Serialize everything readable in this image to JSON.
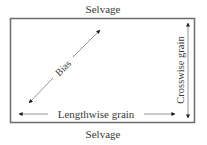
{
  "diagram": {
    "labels": {
      "top_edge": "Selvage",
      "bottom_edge": "Selvage",
      "bias": "Bias",
      "lengthwise": "Lengthwise grain",
      "crosswise": "Crosswise grain"
    },
    "colors": {
      "border": "#6b6b6b",
      "arrow": "#1a1a1a",
      "line": "#7a7a7a",
      "text": "#3a3a3a",
      "background": "#ffffff"
    },
    "fabric_rect": {
      "x": 10,
      "y": 18,
      "width": 185,
      "height": 105
    },
    "arrows": [
      {
        "name": "bias",
        "from": [
          28,
          104
        ],
        "to": [
          101,
          29
        ],
        "bidirectional": true
      },
      {
        "name": "lengthwise-grain",
        "from": [
          18,
          114
        ],
        "to": [
          176,
          114
        ],
        "bidirectional": true
      },
      {
        "name": "crosswise-grain",
        "from": [
          188,
          22
        ],
        "to": [
          188,
          119
        ],
        "bidirectional": true
      }
    ]
  }
}
